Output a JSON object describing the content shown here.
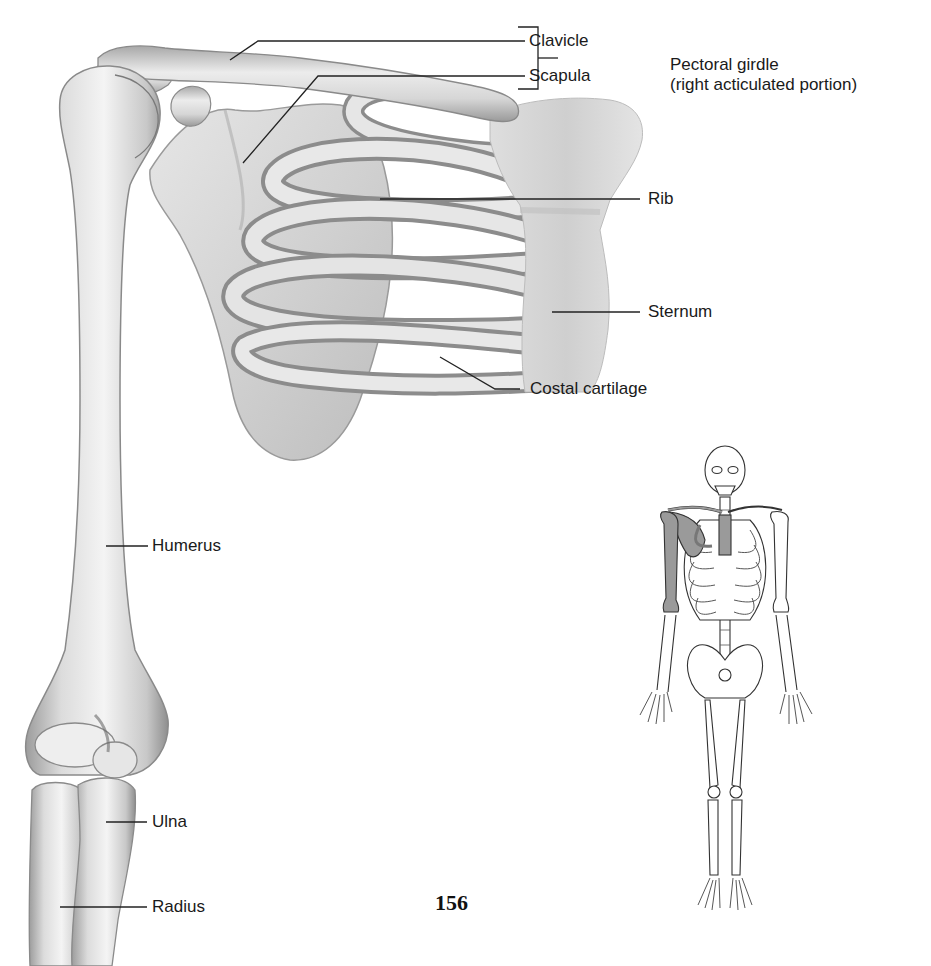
{
  "figure": {
    "title_hint": "Bones of the right pectoral girdle and upper limb, anterior view",
    "labels": {
      "clavicle": "Clavicle",
      "scapula": "Scapula",
      "pectoral_girdle_line1": "Pectoral girdle",
      "pectoral_girdle_line2": "(right acticulated portion)",
      "rib": "Rib",
      "sternum": "Sternum",
      "costal_cartilage": "Costal cartilage",
      "humerus": "Humerus",
      "ulna": "Ulna",
      "radius": "Radius"
    },
    "page_number": "156",
    "colors": {
      "bone_light": "#f2f2f2",
      "bone_mid": "#cfcfcf",
      "bone_shadow": "#8a8a8a",
      "leader_line": "#222222",
      "skeleton_outline": "#333333",
      "skeleton_highlight": "#9a9a9a"
    }
  }
}
